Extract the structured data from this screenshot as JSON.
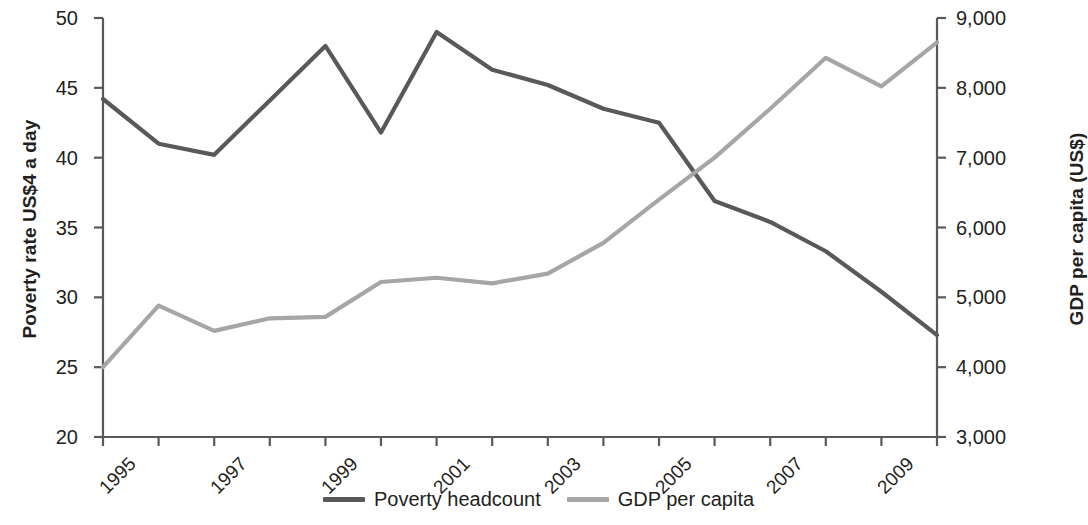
{
  "chart_data": {
    "type": "line",
    "title": "",
    "xlabel": "",
    "ylabel": "Poverty rate US$4 a day",
    "y2label": "GDP per capita (US$)",
    "grid": false,
    "legend_position": "bottom-center",
    "x": [
      1995,
      1996,
      1997,
      1998,
      1999,
      2000,
      2001,
      2002,
      2003,
      2004,
      2005,
      2006,
      2007,
      2008,
      2009,
      2010
    ],
    "xtick_labels": [
      "1995",
      "1997",
      "1999",
      "2001",
      "2003",
      "2005",
      "2007",
      "2009"
    ],
    "xtick_values": [
      1995,
      1997,
      1999,
      2001,
      2003,
      2005,
      2007,
      2009
    ],
    "xlim": [
      1995,
      2010
    ],
    "ylim": [
      20,
      50
    ],
    "ytick_labels": [
      "20",
      "25",
      "30",
      "35",
      "40",
      "45",
      "50"
    ],
    "ytick_values": [
      20,
      25,
      30,
      35,
      40,
      45,
      50
    ],
    "y2lim": [
      3000,
      9000
    ],
    "y2tick_labels": [
      "3,000",
      "4,000",
      "5,000",
      "6,000",
      "7,000",
      "8,000",
      "9,000"
    ],
    "y2tick_values": [
      3000,
      4000,
      5000,
      6000,
      7000,
      8000,
      9000
    ],
    "series": [
      {
        "name": "Poverty headcount",
        "axis": "left",
        "color": "#595959",
        "values": [
          44.2,
          41.0,
          40.2,
          44.1,
          48.0,
          41.8,
          49.0,
          46.3,
          45.2,
          43.5,
          42.5,
          36.9,
          35.4,
          33.3,
          30.4,
          27.3
        ]
      },
      {
        "name": "GDP per capita",
        "axis": "right",
        "color": "#a6a6a6",
        "values": [
          4000,
          4880,
          4520,
          4700,
          4720,
          5220,
          5280,
          5200,
          5340,
          5780,
          6400,
          7000,
          7700,
          8430,
          8020,
          8650
        ]
      }
    ]
  },
  "legend": {
    "items": [
      {
        "label": "Poverty headcount",
        "color": "#595959"
      },
      {
        "label": "GDP per capita",
        "color": "#a6a6a6"
      }
    ]
  },
  "axes": {
    "left_title": "Poverty rate US$4 a day",
    "right_title": "GDP per capita (US$)"
  }
}
